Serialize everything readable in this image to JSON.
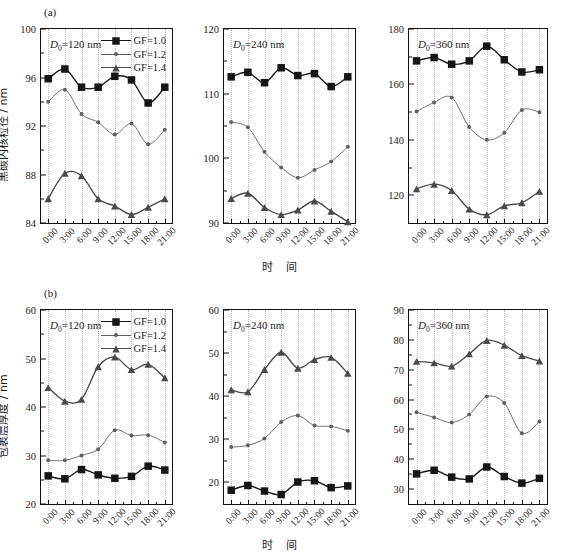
{
  "figure": {
    "panel_a_tag": "(a)",
    "panel_b_tag": "(b)",
    "xaxis_title": "时 间",
    "ylabel_a": "黑碳内核粒径 / nm",
    "ylabel_b": "包裹层厚度 / nm",
    "caption": ""
  },
  "legend": {
    "entries": [
      {
        "label": "GF=1.0",
        "marker": "square",
        "color": "#161616"
      },
      {
        "label": "GF=1.2",
        "marker": "circle",
        "color": "#606060"
      },
      {
        "label": "GF=1.4",
        "marker": "triangle",
        "color": "#4a4a4a"
      }
    ]
  },
  "colors": {
    "gf10": "#161616",
    "gf12": "#606060",
    "gf14": "#4a4a4a",
    "grid": "#c9b8b8",
    "axis": "#111111"
  },
  "chart_data": [
    {
      "type": "line",
      "panel": "a1",
      "title": "D0=120 nm",
      "d0_label": "D0=120 nm",
      "d0_value": 120,
      "xlabel": "时 间",
      "ylabel": "黑碳内核粒径 / nm",
      "ylim": [
        84,
        100
      ],
      "yticks": [
        84,
        88,
        92,
        96,
        100
      ],
      "categories": [
        "0:00",
        "3:00",
        "6:00",
        "9:00",
        "12:00",
        "15:00",
        "18:00",
        "21:00"
      ],
      "x": [
        0,
        1,
        2,
        3,
        4,
        5,
        6,
        7,
        8,
        9,
        10,
        11
      ],
      "xhours": [
        0,
        2,
        4,
        6,
        8,
        10,
        12,
        14,
        16,
        18,
        20,
        22
      ],
      "grid": true,
      "legend_position": "top-right",
      "series": [
        {
          "name": "GF=1.0",
          "marker": "square",
          "values": [
            95.9,
            96.7,
            95.2,
            95.2,
            96.1,
            95.8,
            93.9,
            95.2
          ]
        },
        {
          "name": "GF=1.2",
          "marker": "circle",
          "values": [
            94.0,
            95.0,
            93.0,
            92.3,
            91.3,
            92.2,
            90.5,
            91.7
          ]
        },
        {
          "name": "GF=1.4",
          "marker": "triangle",
          "values": [
            86.0,
            88.1,
            87.9,
            86.0,
            85.4,
            84.7,
            85.3,
            86.0
          ]
        }
      ]
    },
    {
      "type": "line",
      "panel": "a2",
      "title": "D0=240 nm",
      "d0_label": "D0=240 nm",
      "d0_value": 240,
      "xlabel": "时 间",
      "ylabel": "",
      "ylim": [
        90,
        120
      ],
      "yticks": [
        90,
        100,
        110,
        120
      ],
      "categories": [
        "0:00",
        "3:00",
        "6:00",
        "9:00",
        "12:00",
        "15:00",
        "18:00",
        "21:00"
      ],
      "grid": true,
      "series": [
        {
          "name": "GF=1.0",
          "marker": "square",
          "values": [
            112.6,
            113.3,
            111.7,
            114.0,
            112.8,
            113.1,
            111.1,
            112.6
          ]
        },
        {
          "name": "GF=1.2",
          "marker": "circle",
          "values": [
            105.6,
            104.8,
            101.0,
            98.6,
            97.0,
            98.2,
            99.5,
            101.8
          ]
        },
        {
          "name": "GF=1.4",
          "marker": "triangle",
          "values": [
            93.8,
            94.6,
            92.4,
            91.3,
            92.0,
            93.4,
            91.8,
            90.2
          ]
        }
      ]
    },
    {
      "type": "line",
      "panel": "a3",
      "title": "D0=360 nm",
      "d0_label": "D0=360 nm",
      "d0_value": 360,
      "xlabel": "时 间",
      "ylabel": "",
      "ylim": [
        110,
        180
      ],
      "yticks": [
        120,
        140,
        160,
        180
      ],
      "categories": [
        "0:00",
        "3:00",
        "6:00",
        "9:00",
        "12:00",
        "15:00",
        "18:00",
        "21:00"
      ],
      "grid": true,
      "series": [
        {
          "name": "GF=1.0",
          "marker": "square",
          "values": [
            168.5,
            169.7,
            167.3,
            168.5,
            173.8,
            168.9,
            164.5,
            165.3
          ]
        },
        {
          "name": "GF=1.2",
          "marker": "circle",
          "values": [
            150.2,
            153.5,
            155.3,
            144.6,
            140.0,
            142.6,
            150.8,
            150.0
          ]
        },
        {
          "name": "GF=1.4",
          "marker": "triangle",
          "values": [
            122.3,
            124.0,
            121.7,
            115.0,
            113.0,
            116.2,
            117.3,
            121.4
          ]
        }
      ]
    },
    {
      "type": "line",
      "panel": "b1",
      "title": "D0=120 nm",
      "d0_label": "D0=120 nm",
      "d0_value": 120,
      "xlabel": "时 间",
      "ylabel": "包裹层厚度 / nm",
      "ylim": [
        20,
        60
      ],
      "yticks": [
        20,
        30,
        40,
        50,
        60
      ],
      "categories": [
        "0:00",
        "3:00",
        "6:00",
        "9:00",
        "12:00",
        "15:00",
        "18:00",
        "21:00"
      ],
      "grid": true,
      "legend_position": "top-right",
      "series": [
        {
          "name": "GF=1.0",
          "marker": "square",
          "values": [
            25.8,
            25.2,
            27.1,
            26.0,
            25.3,
            25.7,
            27.8,
            27.0
          ]
        },
        {
          "name": "GF=1.2",
          "marker": "circle",
          "values": [
            29.0,
            29.0,
            30.0,
            31.3,
            35.2,
            34.1,
            34.2,
            32.7
          ]
        },
        {
          "name": "GF=1.4",
          "marker": "triangle",
          "values": [
            44.0,
            41.2,
            41.6,
            48.3,
            50.3,
            47.7,
            48.8,
            46.0
          ]
        }
      ]
    },
    {
      "type": "line",
      "panel": "b2",
      "title": "D0=240 nm",
      "d0_label": "D0=240 nm",
      "d0_value": 240,
      "xlabel": "时 间",
      "ylabel": "",
      "ylim": [
        15,
        60
      ],
      "yticks": [
        20,
        30,
        40,
        50,
        60
      ],
      "categories": [
        "0:00",
        "3:00",
        "6:00",
        "9:00",
        "12:00",
        "15:00",
        "18:00",
        "21:00"
      ],
      "grid": true,
      "series": [
        {
          "name": "GF=1.0",
          "marker": "square",
          "values": [
            18.2,
            19.3,
            18.0,
            17.2,
            20.1,
            20.4,
            18.8,
            19.2
          ]
        },
        {
          "name": "GF=1.2",
          "marker": "circle",
          "values": [
            28.2,
            28.6,
            30.2,
            34.0,
            35.5,
            33.2,
            33.0,
            32.0
          ]
        },
        {
          "name": "GF=1.4",
          "marker": "triangle",
          "values": [
            41.5,
            41.0,
            46.2,
            50.2,
            46.5,
            48.5,
            49.0,
            45.3
          ]
        }
      ]
    },
    {
      "type": "line",
      "panel": "b3",
      "title": "D0=360 nm",
      "d0_label": "D0=360 nm",
      "d0_value": 360,
      "xlabel": "时 间",
      "ylabel": "",
      "ylim": [
        25,
        90
      ],
      "yticks": [
        30,
        40,
        50,
        60,
        70,
        80,
        90
      ],
      "categories": [
        "0:00",
        "3:00",
        "6:00",
        "9:00",
        "12:00",
        "15:00",
        "18:00",
        "21:00"
      ],
      "grid": true,
      "series": [
        {
          "name": "GF=1.0",
          "marker": "square",
          "values": [
            35.1,
            36.3,
            34.0,
            33.4,
            37.4,
            34.2,
            32.0,
            33.6
          ]
        },
        {
          "name": "GF=1.2",
          "marker": "circle",
          "values": [
            55.7,
            54.0,
            52.3,
            55.0,
            61.0,
            58.8,
            48.7,
            52.6
          ]
        },
        {
          "name": "GF=1.4",
          "marker": "triangle",
          "values": [
            72.8,
            72.3,
            71.2,
            75.3,
            79.8,
            78.2,
            74.7,
            72.9
          ]
        }
      ]
    }
  ]
}
